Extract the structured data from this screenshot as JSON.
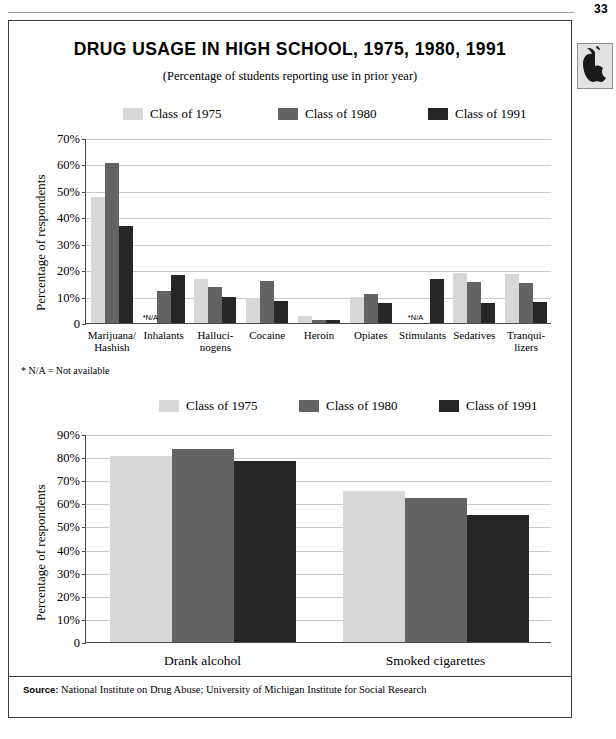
{
  "page": {
    "number": "33",
    "logo_icon": "apple-logo-icon"
  },
  "panel": {
    "title": "DRUG USAGE IN HIGH SCHOOL, 1975, 1980, 1991",
    "subtitle": "(Percentage of students reporting use in prior year)",
    "footnote": "* N/A = Not available",
    "source_prefix": "Source:",
    "source_text": "National Institute on Drug Abuse; University of Michigan Institute for Social Research"
  },
  "colors": {
    "class_1975": "#d7d7d7",
    "class_1980": "#636363",
    "class_1991": "#262626",
    "gridline": "#c9c9c9",
    "axis": "#4a4a4a",
    "frame": "#3a3a3a"
  },
  "legend": {
    "items": [
      {
        "label": "Class of 1975",
        "color_key": "class_1975"
      },
      {
        "label": "Class of 1980",
        "color_key": "class_1980"
      },
      {
        "label": "Class of 1991",
        "color_key": "class_1991"
      }
    ]
  },
  "chart_data": [
    {
      "id": "drug-usage-by-substance",
      "type": "bar",
      "title": "DRUG USAGE IN HIGH SCHOOL, 1975, 1980, 1991",
      "subtitle": "(Percentage of students reporting use in prior year)",
      "xlabel": "",
      "ylabel": "Percentage of respondents",
      "ylim": [
        0,
        70
      ],
      "ytick_step": 10,
      "ytick_labels": [
        "0",
        "10%",
        "20%",
        "30%",
        "40%",
        "50%",
        "60%",
        "70%"
      ],
      "grid": true,
      "legend_position": "top",
      "na_marker": "*N/A",
      "categories": [
        "Marijuana/\nHashish",
        "Inhalants",
        "Halluci-\nnogens",
        "Cocaine",
        "Heroin",
        "Opiates",
        "Stimulants",
        "Sedatives",
        "Tranqui-\nlizers"
      ],
      "series": [
        {
          "name": "Class of 1975",
          "color_key": "class_1975",
          "values": [
            47.5,
            null,
            16.5,
            9.5,
            2.5,
            10.0,
            null,
            19.0,
            18.5
          ]
        },
        {
          "name": "Class of 1980",
          "color_key": "class_1980",
          "values": [
            60.5,
            12.2,
            13.5,
            16.0,
            1.0,
            11.0,
            null,
            15.5,
            15.0
          ]
        },
        {
          "name": "Class of 1991",
          "color_key": "class_1991",
          "values": [
            36.8,
            18.0,
            10.0,
            8.5,
            1.0,
            7.5,
            16.5,
            7.5,
            8.0
          ]
        }
      ]
    },
    {
      "id": "alcohol-and-cigarettes",
      "type": "bar",
      "title": "",
      "xlabel": "",
      "ylabel": "Percentage of respondents",
      "ylim": [
        0,
        90
      ],
      "ytick_step": 10,
      "ytick_labels": [
        "0",
        "10%",
        "20%",
        "30%",
        "40%",
        "50%",
        "60%",
        "70%",
        "80%",
        "90%"
      ],
      "grid": true,
      "legend_position": "top",
      "categories": [
        "Drank alcohol",
        "Smoked cigarettes"
      ],
      "series": [
        {
          "name": "Class of 1975",
          "color_key": "class_1975",
          "values": [
            80.5,
            65.5
          ]
        },
        {
          "name": "Class of 1980",
          "color_key": "class_1980",
          "values": [
            83.5,
            62.5
          ]
        },
        {
          "name": "Class of 1991",
          "color_key": "class_1991",
          "values": [
            78.5,
            55.0
          ]
        }
      ]
    }
  ]
}
